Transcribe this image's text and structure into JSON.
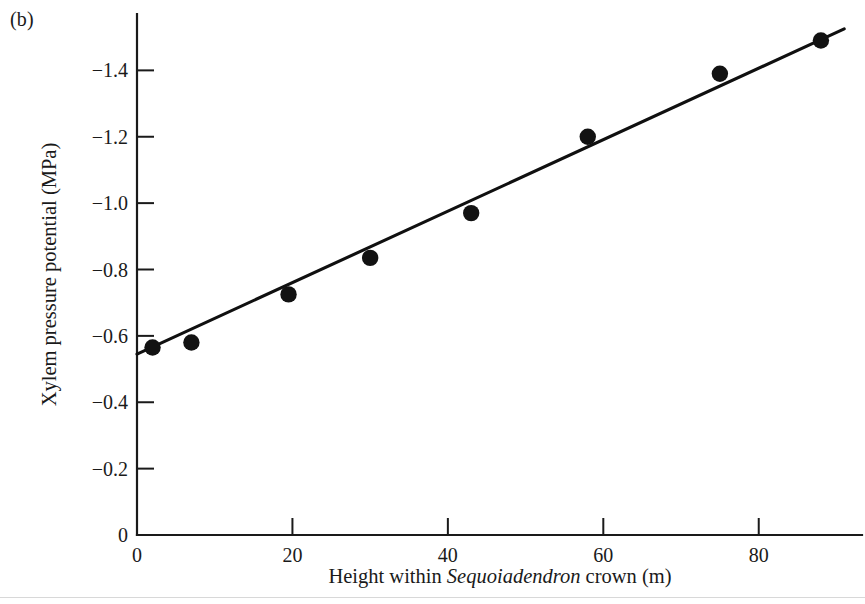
{
  "figure": {
    "panel_label": "(b)",
    "ink_color": "#121212",
    "background": "#ffffff"
  },
  "axis_labels": {
    "x_prefix": "Height within ",
    "x_species": "Sequoiadendron",
    "x_suffix": " crown (m)",
    "x_full": "Height within Sequoiadendron crown (m)",
    "y_full": "Xylem pressure potential (MPa)"
  },
  "chart_data": {
    "type": "scatter",
    "title": "",
    "subtitle": "",
    "xlabel": "Height within Sequoiadendron crown (m)",
    "ylabel": "Xylem pressure potential (MPa)",
    "xlim": [
      0,
      92
    ],
    "ylim": [
      0,
      -1.6
    ],
    "y_inverted": true,
    "grid": false,
    "legend": null,
    "xticks": [
      0,
      20,
      40,
      60,
      80
    ],
    "xticklabels": [
      "0",
      "20",
      "40",
      "60",
      "80"
    ],
    "yticks": [
      0,
      -0.2,
      -0.4,
      -0.6,
      -0.8,
      -1.0,
      -1.2,
      -1.4
    ],
    "yticklabels": [
      "0",
      "−0.2",
      "−0.4",
      "−0.6",
      "−0.8",
      "−1.0",
      "−1.2",
      "−1.4"
    ],
    "x": [
      2,
      7,
      19.5,
      30,
      43,
      58,
      75,
      88
    ],
    "y": [
      -0.565,
      -0.58,
      -0.725,
      -0.835,
      -0.97,
      -1.2,
      -1.39,
      -1.49
    ],
    "points": [
      {
        "x": 2,
        "y": -0.565
      },
      {
        "x": 7,
        "y": -0.58
      },
      {
        "x": 19.5,
        "y": -0.725
      },
      {
        "x": 30,
        "y": -0.835
      },
      {
        "x": 43,
        "y": -0.97
      },
      {
        "x": 58,
        "y": -1.2
      },
      {
        "x": 75,
        "y": -1.39
      },
      {
        "x": 88,
        "y": -1.49
      }
    ],
    "marker": "filled-circle",
    "marker_color": "#121212",
    "series": [
      {
        "name": "Xylem pressure potential",
        "x": [
          2,
          7,
          19.5,
          30,
          43,
          58,
          75,
          88
        ],
        "values": [
          -0.565,
          -0.58,
          -0.725,
          -0.835,
          -0.97,
          -1.2,
          -1.39,
          -1.49
        ]
      }
    ],
    "fit_line": {
      "type": "linear-regression",
      "x_start": 0,
      "y_start": -0.545,
      "x_end": 91,
      "y_end": -1.525,
      "slope_mpa_per_m": -0.01077,
      "intercept_mpa": -0.545
    }
  }
}
